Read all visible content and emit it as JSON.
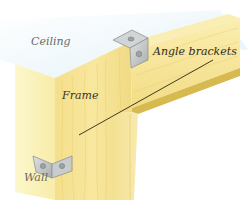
{
  "illustration": {
    "subject": "Door frame fixed to wall and ceiling with angle brackets",
    "labels": {
      "ceiling": "Ceiling",
      "frame": "Frame",
      "angle_brackets": "Angle brackets",
      "wall": "Wall"
    },
    "colors": {
      "ceiling": "#eef7fb",
      "wall": "#fbf3b8",
      "frame_face": "#f6e394",
      "frame_top": "#f9eaa6",
      "frame_underside": "#d9bd55",
      "bracket": "#bfc2c2",
      "bracket_dark": "#8e9292",
      "leader_line": "#2b2614"
    }
  }
}
